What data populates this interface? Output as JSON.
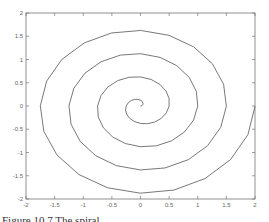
{
  "chart_data": {
    "type": "line",
    "title": "",
    "xlabel": "",
    "ylabel": "",
    "xlim": [
      -2,
      2
    ],
    "ylim": [
      -2,
      2
    ],
    "grid": false,
    "legend": null,
    "x_ticks": [
      "-2",
      "-1.5",
      "-1",
      "-0.5",
      "0",
      "0.5",
      "1",
      "1.5",
      "2"
    ],
    "y_ticks": [
      "-2",
      "-1.5",
      "-1",
      "-0.5",
      "0",
      "0.5",
      "1",
      "1.5",
      "2"
    ],
    "series": [
      {
        "name": "spiral",
        "description": "Archimedean spiral r = theta/(4*pi), theta from 0 to 8*pi (4 turns), coarsely sampled polyline",
        "equation": "x = r*cos(theta), y = r*sin(theta), r = theta/(4*pi)",
        "theta_range": [
          0,
          25.13
        ],
        "r_max": 2,
        "turns": 4,
        "color": "#555555"
      }
    ]
  },
  "caption": {
    "text": "Figure 10.7  The spiral ..."
  }
}
